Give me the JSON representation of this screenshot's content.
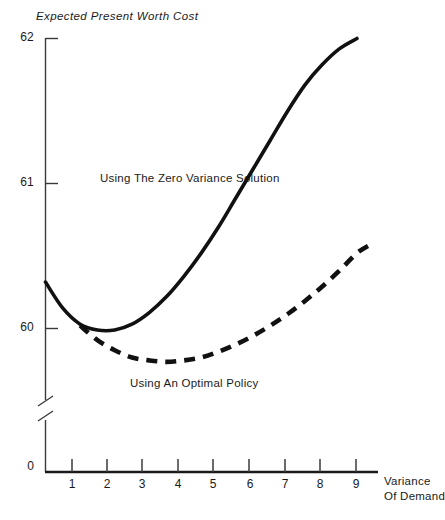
{
  "figure": {
    "title": "Expected Present Worth Cost",
    "caption": ""
  },
  "axes": {
    "y": {
      "label": "Expected Present Worth Cost",
      "ticks": [
        "62",
        "61",
        "60",
        "0"
      ],
      "break_between": [
        "60",
        "0"
      ]
    },
    "x": {
      "label_line1": "Variance",
      "label_line2": "Of Demand",
      "ticks": [
        "1",
        "2",
        "3",
        "4",
        "5",
        "6",
        "7",
        "8",
        "9"
      ]
    }
  },
  "annotations": {
    "solid_curve_label": "Using The Zero Variance Solution",
    "dashed_curve_label": "Using An Optimal Policy"
  },
  "chart_data": {
    "type": "line",
    "title": "Expected Present Worth Cost",
    "xlabel": "Variance Of Demand",
    "ylabel": "Expected Present Worth Cost",
    "xlim": [
      0,
      9.6
    ],
    "ylim": [
      59.6,
      62.0
    ],
    "yticks": [
      60,
      61,
      62
    ],
    "xticks": [
      1,
      2,
      3,
      4,
      5,
      6,
      7,
      8,
      9
    ],
    "grid": false,
    "legend": "inline-annotations",
    "axis_break": {
      "axis": "y",
      "between": [
        0,
        59.6
      ]
    },
    "series": [
      {
        "name": "Using The Zero Variance Solution",
        "style": "solid",
        "color": "#111111",
        "x": [
          0.0,
          0.5,
          1.0,
          1.5,
          2.0,
          2.5,
          3.0,
          3.5,
          4.0,
          4.5,
          5.0,
          5.5,
          6.0,
          6.5,
          7.0,
          7.5,
          8.0,
          8.5,
          9.0
        ],
        "y": [
          60.32,
          60.14,
          60.03,
          59.99,
          59.99,
          60.03,
          60.11,
          60.22,
          60.36,
          60.52,
          60.7,
          60.9,
          61.1,
          61.3,
          61.5,
          61.68,
          61.82,
          61.93,
          62.0
        ]
      },
      {
        "name": "Using An Optimal Policy",
        "style": "dashed",
        "color": "#111111",
        "x": [
          1.0,
          1.5,
          2.0,
          2.5,
          3.0,
          3.5,
          4.0,
          4.5,
          5.0,
          5.5,
          6.0,
          6.5,
          7.0,
          7.5,
          8.0,
          8.5,
          9.0,
          9.4
        ],
        "y": [
          60.02,
          59.92,
          59.85,
          59.8,
          59.78,
          59.77,
          59.78,
          59.8,
          59.84,
          59.89,
          59.95,
          60.02,
          60.1,
          60.19,
          60.29,
          60.4,
          60.52,
          60.58
        ]
      }
    ]
  }
}
